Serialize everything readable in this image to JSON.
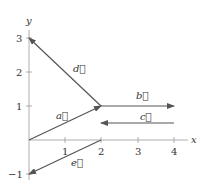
{
  "diagram": {
    "axes": {
      "x_label": "x",
      "y_label": "y",
      "x_ticks": [
        "1",
        "2",
        "3",
        "4"
      ],
      "y_ticks": [
        "3",
        "2",
        "1",
        "−1"
      ]
    },
    "vectors": [
      {
        "name": "a",
        "label": "a⃗",
        "from": [
          0,
          0
        ],
        "to": [
          2,
          1
        ]
      },
      {
        "name": "b",
        "label": "b⃗",
        "from": [
          2,
          1
        ],
        "to": [
          4,
          1
        ]
      },
      {
        "name": "c",
        "label": "c⃗",
        "from": [
          4,
          0.5
        ],
        "to": [
          2,
          0.5
        ]
      },
      {
        "name": "d",
        "label": "d⃗",
        "from": [
          2,
          1
        ],
        "to": [
          0,
          3
        ]
      },
      {
        "name": "e",
        "label": "e⃗",
        "from": [
          2,
          0
        ],
        "to": [
          0,
          -1
        ]
      }
    ],
    "colors": {
      "line": "#555555",
      "text": "#333333"
    }
  }
}
